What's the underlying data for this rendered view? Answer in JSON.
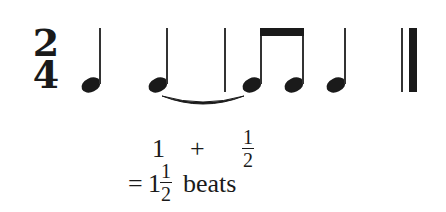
{
  "figure": {
    "time_signature": {
      "numerator": "2",
      "denominator": "4"
    },
    "measure": {
      "notes": [
        {
          "type": "quarter",
          "label": "quarter-note-1"
        },
        {
          "type": "quarter",
          "label": "quarter-note-2",
          "tied_to_next": true
        },
        {
          "type": "eighth",
          "label": "eighth-note-1",
          "beamed": true,
          "tied_from_previous": true
        },
        {
          "type": "eighth",
          "label": "eighth-note-2",
          "beamed": true
        },
        {
          "type": "quarter",
          "label": "quarter-note-3"
        }
      ],
      "barlines": [
        "single",
        "final-double"
      ]
    },
    "colors": {
      "ink": "#1a1a1a",
      "background": "#ffffff"
    }
  },
  "equation": {
    "line1": {
      "term1": "1",
      "operator": "+",
      "term2": {
        "numerator": "1",
        "denominator": "2"
      }
    },
    "line2": {
      "equals": "=",
      "whole": "1",
      "fraction": {
        "numerator": "1",
        "denominator": "2"
      },
      "unit": "beats"
    }
  }
}
